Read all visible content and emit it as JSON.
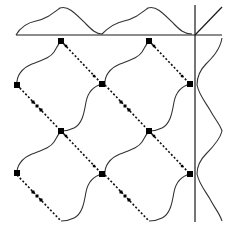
{
  "diagram": {
    "type": "tiling-pattern-with-profiles",
    "colors": {
      "background": "#ffffff",
      "lines": "#1a1a1a",
      "curves": "#333333",
      "nodes": "#000000"
    },
    "axes": {
      "horizontal": {
        "x1": 16,
        "y1": 35,
        "x2": 222,
        "y2": 35
      },
      "vertical": {
        "x1": 195,
        "y1": 5,
        "x2": 195,
        "y2": 222
      },
      "diagonal": {
        "x1": 195,
        "y1": 35,
        "x2": 222,
        "y2": 7
      }
    },
    "tiles": [
      {
        "name": "tile-top-left",
        "dx": 0,
        "dy": 0
      },
      {
        "name": "tile-top-right",
        "dx": 88,
        "dy": 0
      },
      {
        "name": "tile-bottom-left",
        "dx": 0,
        "dy": 90
      },
      {
        "name": "tile-bottom-right",
        "dx": 88,
        "dy": 90
      }
    ],
    "nodes": [
      [
        61,
        41
      ],
      [
        149,
        41
      ],
      [
        17,
        85
      ],
      [
        102,
        84
      ],
      [
        190,
        84
      ],
      [
        61,
        131
      ],
      [
        149,
        131
      ],
      [
        17,
        173
      ],
      [
        102,
        174
      ],
      [
        190,
        174
      ]
    ],
    "top_profile_periods": 2,
    "right_profile_periods": 2
  }
}
